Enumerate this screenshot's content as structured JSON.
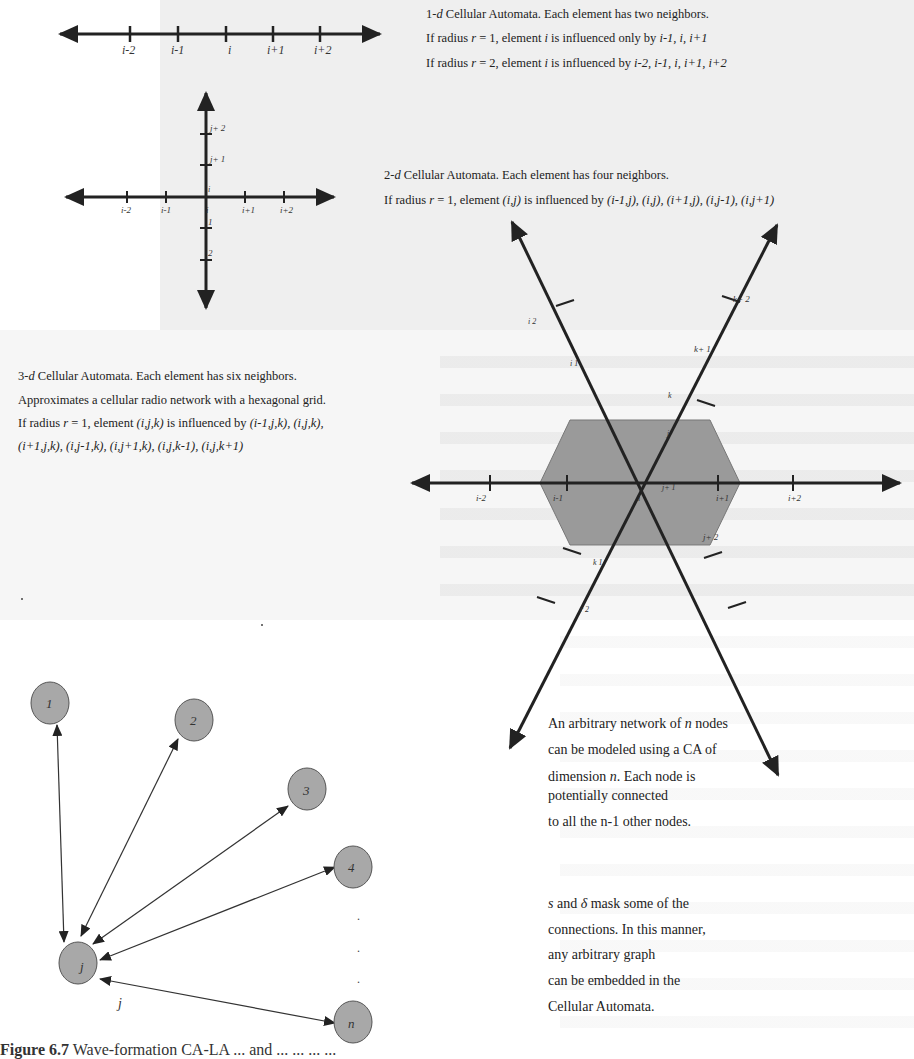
{
  "section_1d": {
    "title_prefix": "1-",
    "title_d": "d",
    "title_rest": " Cellular Automata. Each element has two neighbors.",
    "line2_prefix": "If radius ",
    "line2_r": "r",
    "line2_mid": " = 1, element ",
    "line2_i": "i",
    "line2_mid2": " is influenced only by ",
    "line2_set": "i-1, i, i+1",
    "line3_prefix": "If radius ",
    "line3_r": "r",
    "line3_mid": " = 2, element ",
    "line3_i": "i",
    "line3_mid2": " is influenced by ",
    "line3_set": "i-2, i-1, i, i+1, i+2",
    "axis_ticks": [
      "i-2",
      "i-1",
      "i",
      "i+1",
      "i+2"
    ]
  },
  "section_2d": {
    "title_prefix": "2-",
    "title_d": "d",
    "title_rest": " Cellular Automata. Each element has four neighbors.",
    "line2_prefix": "If radius ",
    "line2_r": "r",
    "line2_mid": " = 1, element ",
    "line2_elem": "(i,j)",
    "line2_mid2": " is influenced by ",
    "line2_set": "(i-1,j), (i,j), (i+1,j), (i,j-1), (i,j+1)",
    "x_ticks": [
      "i-2",
      "i-1",
      "i",
      "i+1",
      "i+2"
    ],
    "y_ticks": [
      "j+ 2",
      "j+ 1",
      "i",
      "1",
      "2"
    ]
  },
  "section_3d": {
    "title_prefix": "3-",
    "title_d": "d",
    "title_rest": " Cellular Automata. Each element has six neighbors.",
    "line2": "Approximates a cellular radio network with a hexagonal grid.",
    "line3_prefix": "If radius ",
    "line3_r": "r",
    "line3_mid": " = 1, element ",
    "line3_elem": "(i,j,k)",
    "line3_mid2": " is influenced by ",
    "line3_set": "(i-1,j,k), (i,j,k),",
    "line4_set": "(i+1,j,k), (i,j-1,k), (i,j+1,k), (i,j,k-1), (i,j,k+1)",
    "x_ticks": [
      "i-2",
      "i-1",
      "i",
      "i+1",
      "i+2"
    ],
    "axis_labels": [
      "k+ 2",
      "k+ 1",
      "k",
      "j",
      "j+ 1",
      "j+ 2",
      "i 1",
      "i 2",
      "k 1",
      "r 2"
    ],
    "hex_fill": "#9a9a9a"
  },
  "section_graph": {
    "nodes": [
      "1",
      "2",
      "3",
      "4",
      "j",
      "n"
    ],
    "j_label": "j",
    "ellipsis": [
      ".",
      ".",
      "."
    ],
    "node_fill": "#a8a8a8",
    "text1": {
      "l1_prefix": "An arbitrary network of ",
      "l1_n": "n",
      "l1_suffix": " nodes",
      "l2": "can be modeled using a CA of",
      "l3_prefix": "dimension ",
      "l3_n": "n",
      "l3_suffix": ". Each node is",
      "l4": "potentially connected",
      "l5": "to all the n-1 other nodes."
    },
    "text2": {
      "l1_s": "s",
      "l1_and": " and ",
      "l1_delta": "δ",
      "l1_suffix": "  mask some of the",
      "l2": "connections. In this manner,",
      "l3": "any arbitrary graph",
      "l4": "can be embedded in the",
      "l5": "Cellular Automata."
    }
  },
  "caption": {
    "label": "Figure 6.7",
    "text": " Wave-formation CA-LA ... and ... ... ... ..."
  }
}
